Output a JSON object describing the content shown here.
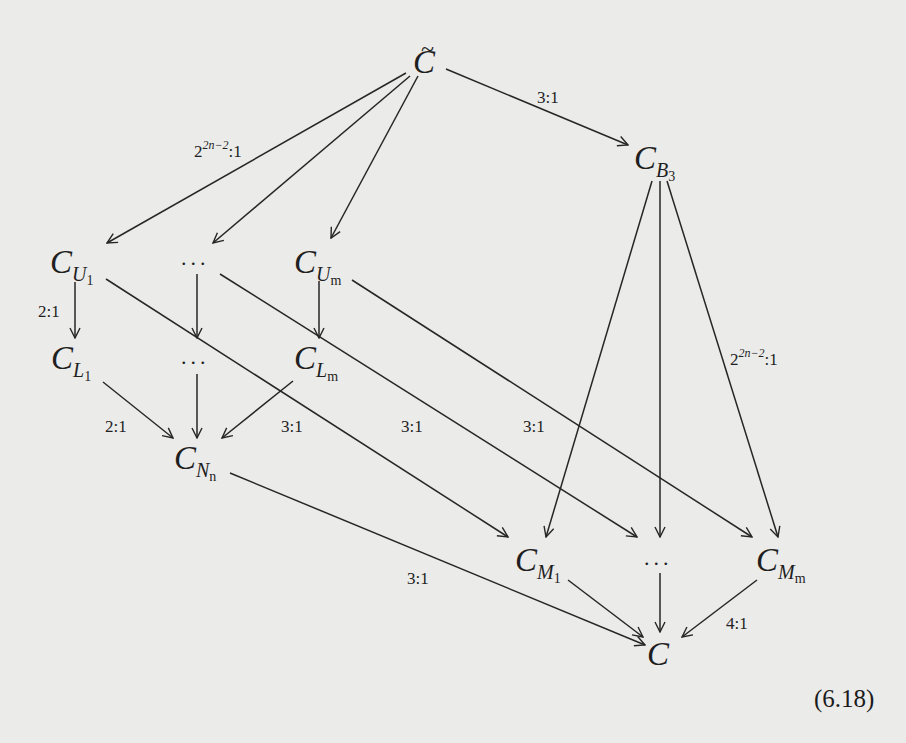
{
  "diagram": {
    "equation_number": "(6.18)",
    "nodes": {
      "c_tilde": {
        "base": "C",
        "accent": "~",
        "sub": "",
        "subsub": ""
      },
      "c_b3": {
        "base": "C",
        "sub": "B",
        "subsub": "3"
      },
      "c_u1": {
        "base": "C",
        "sub": "U",
        "subsub": "1"
      },
      "u_dots": {
        "text": "..."
      },
      "c_um": {
        "base": "C",
        "sub": "U",
        "subsub": "m"
      },
      "c_l1": {
        "base": "C",
        "sub": "L",
        "subsub": "1"
      },
      "l_dots": {
        "text": "..."
      },
      "c_lm": {
        "base": "C",
        "sub": "L",
        "subsub": "m"
      },
      "c_nn": {
        "base": "C",
        "sub": "N",
        "subsub": "n"
      },
      "c_m1": {
        "base": "C",
        "sub": "M",
        "subsub": "1"
      },
      "m_dots": {
        "text": "..."
      },
      "c_mm": {
        "base": "C",
        "sub": "M",
        "subsub": "m"
      },
      "c": {
        "base": "C"
      }
    },
    "labels": {
      "ctilde_to_u_base": "2",
      "ctilde_to_u_exp": "2n−2",
      "ctilde_to_u_tail": ":1",
      "ctilde_to_b3": "3:1",
      "u1_to_l1": "2:1",
      "l1_to_nn": "2:1",
      "u1_to_m1": "3:1",
      "udots_to_mdots": "3:1",
      "um_to_mm": "3:1",
      "b3_to_m_base": "2",
      "b3_to_m_exp": "2n−2",
      "b3_to_m_tail": ":1",
      "nn_to_c": "3:1",
      "mm_to_c": "4:1"
    },
    "edges": [
      {
        "from": "c_tilde",
        "to": "c_u1",
        "label": "2^{2n-2}:1"
      },
      {
        "from": "c_tilde",
        "to": "u_dots",
        "label": ""
      },
      {
        "from": "c_tilde",
        "to": "c_um",
        "label": ""
      },
      {
        "from": "c_tilde",
        "to": "c_b3",
        "label": "3:1"
      },
      {
        "from": "c_u1",
        "to": "c_l1",
        "label": "2:1"
      },
      {
        "from": "u_dots",
        "to": "l_dots",
        "label": ""
      },
      {
        "from": "c_um",
        "to": "c_lm",
        "label": ""
      },
      {
        "from": "c_l1",
        "to": "c_nn",
        "label": "2:1"
      },
      {
        "from": "l_dots",
        "to": "c_nn",
        "label": ""
      },
      {
        "from": "c_lm",
        "to": "c_nn",
        "label": ""
      },
      {
        "from": "c_u1",
        "to": "c_m1",
        "label": "3:1"
      },
      {
        "from": "u_dots",
        "to": "m_dots",
        "label": "3:1"
      },
      {
        "from": "c_um",
        "to": "c_mm",
        "label": "3:1"
      },
      {
        "from": "c_b3",
        "to": "c_m1",
        "label": ""
      },
      {
        "from": "c_b3",
        "to": "m_dots",
        "label": ""
      },
      {
        "from": "c_b3",
        "to": "c_mm",
        "label": "2^{2n-2}:1"
      },
      {
        "from": "c_nn",
        "to": "c",
        "label": "3:1"
      },
      {
        "from": "c_m1",
        "to": "c",
        "label": ""
      },
      {
        "from": "m_dots",
        "to": "c",
        "label": ""
      },
      {
        "from": "c_mm",
        "to": "c",
        "label": "4:1"
      }
    ]
  }
}
